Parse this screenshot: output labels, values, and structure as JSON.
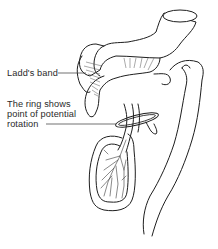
{
  "figure": {
    "labels": {
      "ladds_band": "Ladd's band",
      "ring_line1": "The ring shows",
      "ring_line2": "point of potential",
      "ring_line3": "rotation"
    },
    "colors": {
      "line": "#1e1e1e",
      "text": "#2a2a2a",
      "background": "#ffffff"
    }
  }
}
